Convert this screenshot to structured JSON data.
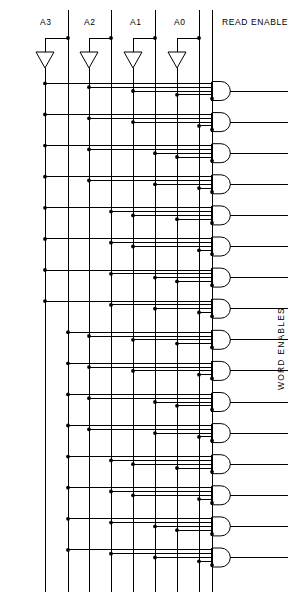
{
  "diagram": {
    "title_absent": true,
    "type": "logic-schematic",
    "input_labels": [
      "A3",
      "A2",
      "A1",
      "A0"
    ],
    "control_label": "READ ENABLE",
    "output_group_label": "WORD ENABLES",
    "input_count": 4,
    "gate_count": 16,
    "gate_input_count": 5,
    "gate_type": "AND",
    "buffer_type": "inverter-triangle",
    "colors": {
      "line": "#000000",
      "background": "#ffffff",
      "junction": "#000000"
    }
  },
  "geometry": {
    "inputs": [
      {
        "label": "A3",
        "label_x": 47,
        "true_x": 68,
        "comp_x": 45,
        "tri_x": 45
      },
      {
        "label": "A2",
        "label_x": 101,
        "true_x": 111,
        "comp_x": 89,
        "tri_x": 89
      },
      {
        "label": "A1",
        "label_x": 148,
        "true_x": 155,
        "comp_x": 133,
        "tri_x": 133
      },
      {
        "label": "A0",
        "label_x": 194,
        "true_x": 199,
        "comp_x": 177,
        "tri_x": 177
      }
    ],
    "read_enable": {
      "label_x": 229,
      "label_y": 22,
      "x": 212
    },
    "bus_top_y": 38,
    "tri_top_y": 52,
    "tri_bot_y": 68,
    "gate_first_y": 91,
    "gate_pitch": 31.1,
    "gate_left_x": 212,
    "gate_body_w": 21,
    "gate_body_h": 19,
    "gate_out_x2": 288,
    "word_enables_label": {
      "x": 276,
      "y": 370
    }
  },
  "truth": {
    "note": "Gate n selects complement line when address bit is 0, true line when bit is 1",
    "rows": [
      {
        "index": 0,
        "bits": [
          0,
          0,
          0,
          0
        ]
      },
      {
        "index": 1,
        "bits": [
          0,
          0,
          0,
          1
        ]
      },
      {
        "index": 2,
        "bits": [
          0,
          0,
          1,
          0
        ]
      },
      {
        "index": 3,
        "bits": [
          0,
          0,
          1,
          1
        ]
      },
      {
        "index": 4,
        "bits": [
          0,
          1,
          0,
          0
        ]
      },
      {
        "index": 5,
        "bits": [
          0,
          1,
          0,
          1
        ]
      },
      {
        "index": 6,
        "bits": [
          0,
          1,
          1,
          0
        ]
      },
      {
        "index": 7,
        "bits": [
          0,
          1,
          1,
          1
        ]
      },
      {
        "index": 8,
        "bits": [
          1,
          0,
          0,
          0
        ]
      },
      {
        "index": 9,
        "bits": [
          1,
          0,
          0,
          1
        ]
      },
      {
        "index": 10,
        "bits": [
          1,
          0,
          1,
          0
        ]
      },
      {
        "index": 11,
        "bits": [
          1,
          0,
          1,
          1
        ]
      },
      {
        "index": 12,
        "bits": [
          1,
          1,
          0,
          0
        ]
      },
      {
        "index": 13,
        "bits": [
          1,
          1,
          0,
          1
        ]
      },
      {
        "index": 14,
        "bits": [
          1,
          1,
          1,
          0
        ]
      },
      {
        "index": 15,
        "bits": [
          1,
          1,
          1,
          1
        ]
      }
    ]
  }
}
